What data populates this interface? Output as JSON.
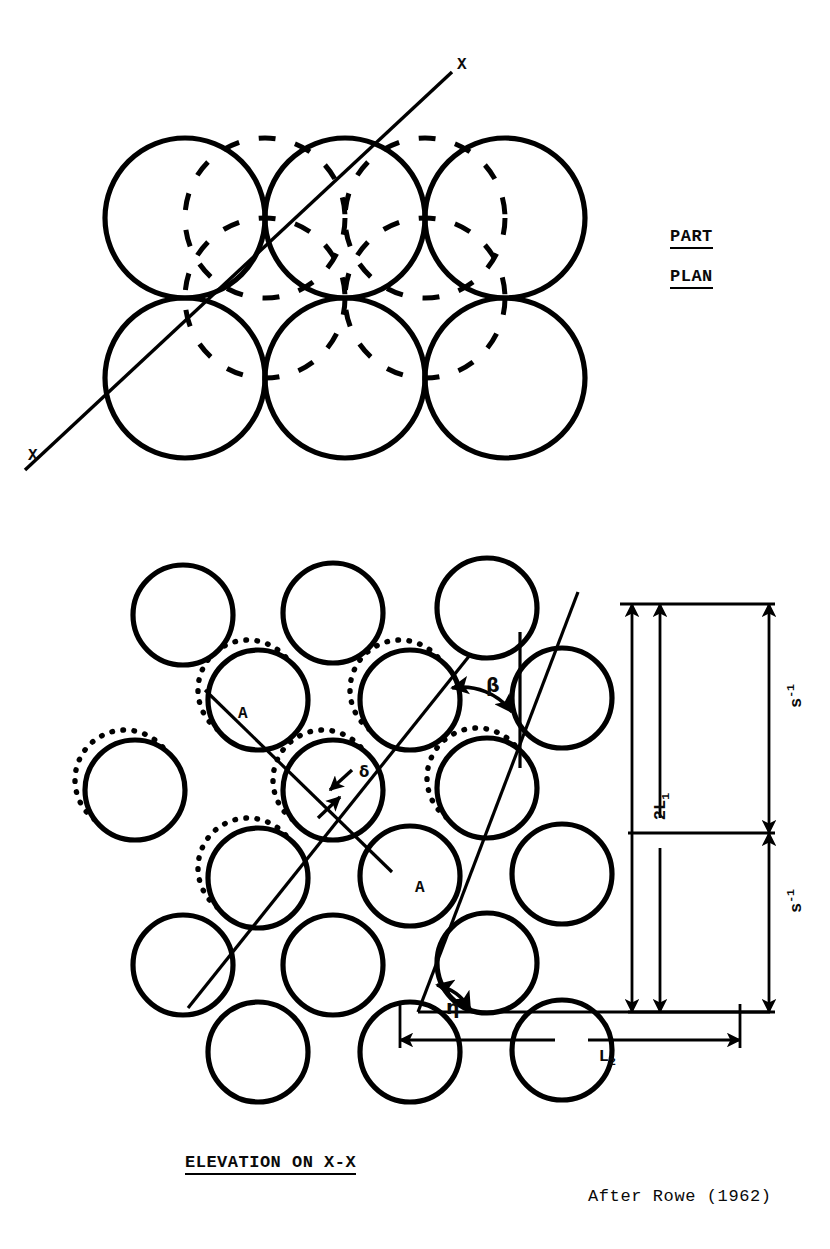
{
  "figure": {
    "title_plan_line1": "PART",
    "title_plan_line2": "PLAN",
    "title_elevation": "ELEVATION ON X-X",
    "credit": "After Rowe (1962)",
    "section_mark_top": "X",
    "section_mark_bottom": "X"
  },
  "plan_view": {
    "name": "part-plan",
    "solid_circle_count": 6,
    "dashed_circle_count": 4,
    "rows": 2,
    "columns": 3,
    "circle_radius": 80,
    "solid_centers": [
      {
        "cx": 185,
        "cy": 218
      },
      {
        "cx": 345,
        "cy": 218
      },
      {
        "cx": 505,
        "cy": 218
      },
      {
        "cx": 185,
        "cy": 378
      },
      {
        "cx": 345,
        "cy": 378
      },
      {
        "cx": 505,
        "cy": 378
      }
    ],
    "dashed_centers": [
      {
        "cx": 265,
        "cy": 298
      },
      {
        "cx": 425,
        "cy": 298
      },
      {
        "cx": 265,
        "cy": 218
      },
      {
        "cx": 425,
        "cy": 218
      }
    ],
    "section_line": {
      "x1": 25,
      "y1": 470,
      "x2": 450,
      "y2": 75
    }
  },
  "elevation_view": {
    "name": "elevation-on-x-x",
    "circle_radius": 50,
    "solid_centers": [
      {
        "cx": 183,
        "cy": 615
      },
      {
        "cx": 333,
        "cy": 613
      },
      {
        "cx": 487,
        "cy": 608
      },
      {
        "cx": 258,
        "cy": 700
      },
      {
        "cx": 410,
        "cy": 700
      },
      {
        "cx": 562,
        "cy": 698
      },
      {
        "cx": 135,
        "cy": 790
      },
      {
        "cx": 333,
        "cy": 790
      },
      {
        "cx": 487,
        "cy": 788
      },
      {
        "cx": 258,
        "cy": 878
      },
      {
        "cx": 410,
        "cy": 876
      },
      {
        "cx": 562,
        "cy": 874
      },
      {
        "cx": 183,
        "cy": 965
      },
      {
        "cx": 333,
        "cy": 965
      },
      {
        "cx": 487,
        "cy": 963
      },
      {
        "cx": 258,
        "cy": 1052
      },
      {
        "cx": 410,
        "cy": 1052
      },
      {
        "cx": 562,
        "cy": 1050
      }
    ],
    "dotted_centers": [
      {
        "cx": 248,
        "cy": 690
      },
      {
        "cx": 400,
        "cy": 690
      },
      {
        "cx": 125,
        "cy": 780
      },
      {
        "cx": 323,
        "cy": 780
      },
      {
        "cx": 477,
        "cy": 778
      },
      {
        "cx": 248,
        "cy": 868
      }
    ],
    "labels": {
      "particle_a_upper": "A",
      "particle_a_lower": "A",
      "angle_beta": "β",
      "angle_eta": "η",
      "displacement_delta": "δ"
    },
    "dimensions": [
      {
        "id": "s-inv-upper",
        "base": "s",
        "exponent": "-1",
        "orientation": "vertical"
      },
      {
        "id": "two-l-one",
        "base": "2L",
        "subscript": "1",
        "orientation": "vertical"
      },
      {
        "id": "s-inv-lower",
        "base": "s",
        "exponent": "-1",
        "orientation": "vertical"
      },
      {
        "id": "l-two",
        "base": "L",
        "subscript": "2",
        "orientation": "horizontal"
      }
    ]
  },
  "dim_text": {
    "s_upper_base": "s",
    "s_upper_exp": "-1",
    "s_lower_base": "s",
    "s_lower_exp": "-1",
    "l1_base": "2L",
    "l1_sub": "1",
    "l2_base": "L",
    "l2_sub": "2"
  },
  "style": {
    "ink": "#000000",
    "paper": "#ffffff"
  }
}
